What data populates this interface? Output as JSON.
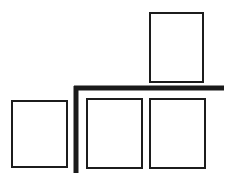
{
  "canvas": {
    "width": 234,
    "height": 190,
    "background": "#ffffff",
    "title": "Shelf bracket layout diagram"
  },
  "style": {
    "frame_stroke_color": "#1c1c1c",
    "frame_stroke_width": 2,
    "frame_fill": "#ffffff",
    "bar_color": "#1a1a1a",
    "bar_thickness": 5
  },
  "shapes": {
    "rectangles": [
      {
        "name": "top-right-rectangle",
        "label": "Upper right panel",
        "x": 150,
        "y": 13,
        "width": 53,
        "height": 69
      },
      {
        "name": "bottom-left-rectangle",
        "label": "Lower left panel",
        "x": 12,
        "y": 101,
        "width": 55,
        "height": 66
      },
      {
        "name": "bottom-middle-rectangle",
        "label": "Lower middle panel",
        "x": 87,
        "y": 99,
        "width": 55,
        "height": 69
      },
      {
        "name": "bottom-right-rectangle",
        "label": "Lower right panel",
        "x": 150,
        "y": 99,
        "width": 55,
        "height": 69
      }
    ],
    "bars": [
      {
        "name": "horizontal-bar",
        "label": "Horizontal shelf bar",
        "x1": 74,
        "y1": 88,
        "x2": 224,
        "y2": 88
      },
      {
        "name": "vertical-bar",
        "label": "Vertical support bar",
        "x1": 76,
        "y1": 86,
        "x2": 76,
        "y2": 173
      }
    ]
  }
}
